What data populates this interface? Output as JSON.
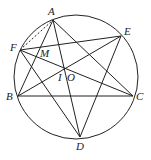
{
  "figure": {
    "circle": {
      "cx": 76,
      "cy": 77,
      "r": 62
    },
    "points": {
      "A": {
        "x": 53,
        "y": 20,
        "label": "A",
        "lx": 48,
        "ly": 15
      },
      "E": {
        "x": 121,
        "y": 36,
        "label": "E",
        "lx": 124,
        "ly": 35
      },
      "F": {
        "x": 20,
        "y": 50,
        "label": "F",
        "lx": 10,
        "ly": 51
      },
      "B": {
        "x": 18,
        "y": 96,
        "label": "B",
        "lx": 6,
        "ly": 100
      },
      "C": {
        "x": 133,
        "y": 96,
        "label": "C",
        "lx": 136,
        "ly": 100
      },
      "D": {
        "x": 80,
        "y": 137,
        "label": "D",
        "lx": 76,
        "ly": 150
      },
      "M": {
        "label": "M",
        "lx": 40,
        "ly": 57
      },
      "I": {
        "label": "I",
        "lx": 58,
        "ly": 81
      },
      "O": {
        "label": "O",
        "lx": 67,
        "ly": 81
      }
    },
    "segments": [
      [
        "A",
        "B"
      ],
      [
        "A",
        "D"
      ],
      [
        "A",
        "C"
      ],
      [
        "F",
        "E"
      ],
      [
        "F",
        "C"
      ],
      [
        "F",
        "D"
      ],
      [
        "E",
        "B"
      ],
      [
        "E",
        "D"
      ],
      [
        "B",
        "C"
      ]
    ],
    "dashed_segments": [
      [
        "F",
        "A"
      ]
    ]
  }
}
